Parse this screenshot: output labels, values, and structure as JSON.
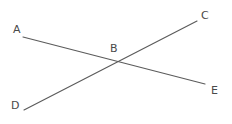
{
  "figure": {
    "type": "geometry-diagram",
    "canvas": {
      "width": 232,
      "height": 124,
      "background": "#ffffff"
    },
    "style": {
      "line_color": "#5b5b5b",
      "line_width": 1.15,
      "label_color": "#4a4a4a",
      "label_font_size": 11
    },
    "points": [
      {
        "id": "A",
        "label": "A",
        "x": 23,
        "y": 37,
        "label_x": 13,
        "label_y": 24
      },
      {
        "id": "B",
        "label": "B",
        "x": 118,
        "y": 62,
        "label_x": 110,
        "label_y": 43
      },
      {
        "id": "C",
        "label": "C",
        "x": 197,
        "y": 21,
        "label_x": 201,
        "label_y": 10
      },
      {
        "id": "D",
        "label": "D",
        "x": 24,
        "y": 110,
        "label_x": 11,
        "label_y": 100
      },
      {
        "id": "E",
        "label": "E",
        "x": 205,
        "y": 84,
        "label_x": 211,
        "label_y": 85
      }
    ],
    "segments": [
      {
        "id": "AE",
        "from": "A",
        "to": "E",
        "x1": 23,
        "y1": 37,
        "x2": 205,
        "y2": 84
      },
      {
        "id": "DC",
        "from": "D",
        "to": "C",
        "x1": 24,
        "y1": 110,
        "x2": 197,
        "y2": 21
      }
    ],
    "intersection": {
      "id": "B",
      "x": 118,
      "y": 62
    }
  }
}
